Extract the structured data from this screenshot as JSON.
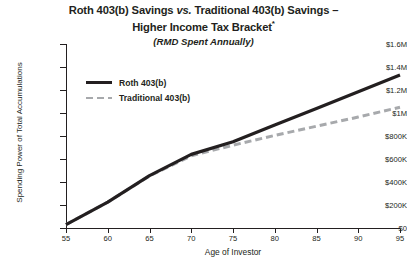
{
  "chart_data": {
    "type": "line",
    "title": "Roth 403(b) Savings vs. Traditional 403(b) Savings – Higher Income Tax Bracket*",
    "title_part1": "Roth 403(b) Savings ",
    "title_vs": "vs.",
    "title_part2": " Traditional 403(b) Savings –",
    "title_line2": "Higher Income Tax Bracket",
    "title_footnote_marker": "*",
    "subtitle": "(RMD Spent Annually)",
    "xlabel": "Age of Investor",
    "ylabel": "Spending Power of Total Accumulations",
    "xlim": [
      55,
      95
    ],
    "ylim": [
      0,
      1600000
    ],
    "grid": false,
    "legend_position": "inside-upper-left",
    "x_ticks": [
      55,
      60,
      65,
      70,
      75,
      80,
      85,
      90,
      95
    ],
    "x_tick_labels": [
      "55",
      "60",
      "65",
      "70",
      "75",
      "80",
      "85",
      "90",
      "95"
    ],
    "y_ticks": [
      0,
      200000,
      400000,
      600000,
      800000,
      1000000,
      1200000,
      1400000,
      1600000
    ],
    "y_tick_labels": [
      "$0",
      "$200K",
      "$400K",
      "$600K",
      "$800K",
      "$1M",
      "$1.2M",
      "$1.4M",
      "$1.6M"
    ],
    "x": [
      55,
      60,
      65,
      70,
      75,
      80,
      85,
      90,
      95
    ],
    "series": [
      {
        "name": "Roth 403(b)",
        "style": "solid",
        "color": "#231f20",
        "values": [
          30000,
          225000,
          455000,
          640000,
          750000,
          895000,
          1040000,
          1185000,
          1330000
        ]
      },
      {
        "name": "Traditional 403(b)",
        "style": "dashed",
        "color": "#a7a9ac",
        "values": [
          30000,
          225000,
          452000,
          628000,
          720000,
          805000,
          885000,
          965000,
          1050000
        ]
      }
    ]
  },
  "legend": {
    "items": [
      {
        "label": "Roth 403(b)"
      },
      {
        "label": "Traditional 403(b)"
      }
    ]
  },
  "colors": {
    "roth": "#231f20",
    "traditional": "#a7a9ac",
    "axis": "#231f20",
    "background": "#ffffff"
  }
}
